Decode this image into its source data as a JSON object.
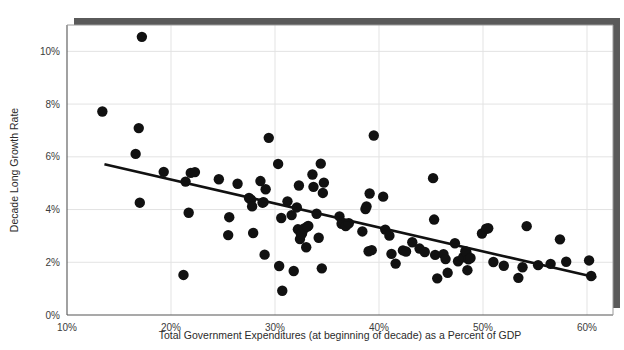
{
  "chart_data": {
    "type": "scatter",
    "title": "",
    "xlabel": "Total Government Expenditures (at beginning of decade) as a Percent of GDP",
    "ylabel": "Decade Long Growth Rate",
    "xlim": [
      10,
      62.5
    ],
    "ylim": [
      0,
      11
    ],
    "xticks": [
      10,
      20,
      30,
      40,
      50,
      60
    ],
    "xticklabels": [
      "10%",
      "20%",
      "30%",
      "40%",
      "50%",
      "60%"
    ],
    "yticks": [
      0,
      2,
      4,
      6,
      8,
      10
    ],
    "yticklabels": [
      "0%",
      "2%",
      "4%",
      "6%",
      "8%",
      "10%"
    ],
    "grid": true,
    "grid_color": "#e3e3e3",
    "legend": "none",
    "marker_color": "#111111",
    "marker_size": 5.2,
    "trendline": {
      "color": "#111111",
      "width": 2.6,
      "x": [
        13.6,
        60.9
      ],
      "y": [
        5.72,
        1.42
      ]
    },
    "points": [
      [
        13.4,
        7.72
      ],
      [
        17.2,
        10.55
      ],
      [
        16.9,
        7.09
      ],
      [
        16.6,
        6.11
      ],
      [
        17.0,
        4.26
      ],
      [
        19.3,
        5.43
      ],
      [
        21.2,
        1.52
      ],
      [
        21.7,
        3.88
      ],
      [
        21.9,
        5.39
      ],
      [
        22.3,
        5.42
      ],
      [
        21.4,
        5.06
      ],
      [
        24.6,
        5.15
      ],
      [
        25.6,
        3.71
      ],
      [
        25.5,
        3.03
      ],
      [
        26.4,
        4.98
      ],
      [
        27.5,
        4.44
      ],
      [
        27.7,
        4.37
      ],
      [
        27.8,
        4.12
      ],
      [
        27.9,
        3.11
      ],
      [
        28.6,
        5.08
      ],
      [
        28.8,
        4.26
      ],
      [
        28.9,
        4.28
      ],
      [
        29.4,
        6.72
      ],
      [
        29.1,
        4.77
      ],
      [
        29.0,
        2.29
      ],
      [
        30.3,
        5.73
      ],
      [
        30.6,
        3.68
      ],
      [
        30.4,
        1.86
      ],
      [
        30.7,
        0.92
      ],
      [
        31.2,
        4.31
      ],
      [
        31.6,
        3.79
      ],
      [
        31.8,
        1.67
      ],
      [
        32.1,
        4.08
      ],
      [
        32.3,
        4.91
      ],
      [
        32.2,
        3.25
      ],
      [
        32.5,
        3.06
      ],
      [
        32.4,
        2.88
      ],
      [
        32.6,
        3.09
      ],
      [
        32.8,
        3.28
      ],
      [
        33.2,
        3.38
      ],
      [
        33.1,
        3.35
      ],
      [
        33.0,
        2.57
      ],
      [
        33.6,
        5.33
      ],
      [
        33.7,
        4.86
      ],
      [
        34.0,
        3.84
      ],
      [
        34.2,
        2.93
      ],
      [
        34.4,
        5.74
      ],
      [
        34.7,
        5.02
      ],
      [
        34.6,
        4.63
      ],
      [
        34.5,
        1.77
      ],
      [
        36.2,
        3.74
      ],
      [
        36.4,
        3.46
      ],
      [
        36.8,
        3.37
      ],
      [
        37.1,
        3.48
      ],
      [
        38.4,
        3.17
      ],
      [
        38.7,
        4.02
      ],
      [
        38.8,
        4.12
      ],
      [
        39.1,
        4.61
      ],
      [
        39.0,
        2.42
      ],
      [
        39.3,
        2.46
      ],
      [
        39.5,
        6.81
      ],
      [
        40.4,
        4.49
      ],
      [
        40.6,
        3.24
      ],
      [
        41.0,
        3.01
      ],
      [
        41.2,
        2.32
      ],
      [
        41.6,
        1.95
      ],
      [
        42.3,
        2.45
      ],
      [
        42.6,
        2.41
      ],
      [
        43.2,
        2.76
      ],
      [
        43.9,
        2.52
      ],
      [
        44.4,
        2.39
      ],
      [
        45.2,
        5.19
      ],
      [
        45.3,
        3.62
      ],
      [
        45.4,
        2.28
      ],
      [
        45.6,
        1.39
      ],
      [
        46.2,
        2.31
      ],
      [
        46.4,
        2.12
      ],
      [
        46.6,
        1.6
      ],
      [
        47.3,
        2.72
      ],
      [
        47.6,
        2.04
      ],
      [
        48.1,
        2.19
      ],
      [
        48.3,
        2.42
      ],
      [
        48.4,
        2.38
      ],
      [
        48.6,
        2.11
      ],
      [
        48.8,
        2.16
      ],
      [
        48.5,
        1.7
      ],
      [
        49.9,
        3.09
      ],
      [
        50.3,
        3.27
      ],
      [
        50.5,
        3.29
      ],
      [
        51.0,
        2.01
      ],
      [
        52.0,
        1.87
      ],
      [
        53.4,
        1.41
      ],
      [
        53.8,
        1.81
      ],
      [
        54.2,
        3.37
      ],
      [
        55.3,
        1.89
      ],
      [
        56.5,
        1.94
      ],
      [
        57.4,
        2.87
      ],
      [
        58.0,
        2.02
      ],
      [
        60.2,
        2.07
      ],
      [
        60.4,
        1.48
      ]
    ]
  },
  "figure": {
    "background": "#ffffff",
    "plot_background": "#ffffff",
    "shadow_color": "#5a5a5a",
    "frame_color": "#555555"
  }
}
